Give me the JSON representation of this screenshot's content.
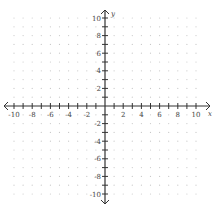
{
  "chart_data": {
    "type": "scatter",
    "title": "",
    "xlabel": "x",
    "ylabel": "y",
    "xlim": [
      -10,
      10
    ],
    "ylim": [
      -10,
      10
    ],
    "x_ticks": [
      -10,
      -8,
      -6,
      -4,
      -2,
      2,
      4,
      6,
      8,
      10
    ],
    "y_ticks": [
      10,
      8,
      6,
      4,
      2,
      -2,
      -4,
      -6,
      -8,
      -10
    ],
    "x_tick_labels": [
      "-10",
      "-8",
      "-6",
      "-4",
      "-2",
      "2",
      "4",
      "6",
      "8",
      "10"
    ],
    "y_tick_labels": [
      "10",
      "8",
      "6",
      "4",
      "2",
      "-2",
      "-4",
      "-6",
      "-8",
      "-10"
    ],
    "minor_tick_step": 1,
    "grid": "dotted",
    "series": [],
    "legend": null
  },
  "axes": {
    "x_label": "x",
    "y_label": "y"
  },
  "colors": {
    "axis": "#333333",
    "grid_dot": "#c8c8c8",
    "label": "#444444"
  }
}
